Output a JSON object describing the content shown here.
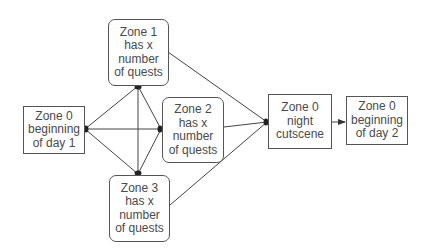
{
  "diagram": {
    "nodes": [
      {
        "id": "zone0_day1",
        "shape": "rect",
        "lines": [
          "Zone 0",
          "beginning",
          "of day 1"
        ]
      },
      {
        "id": "zone1",
        "shape": "rounded",
        "lines": [
          "Zone 1",
          "has x",
          "number",
          "of quests"
        ]
      },
      {
        "id": "zone2",
        "shape": "rounded",
        "lines": [
          "Zone 2",
          "has x",
          "number",
          "of quests"
        ]
      },
      {
        "id": "zone3",
        "shape": "rounded",
        "lines": [
          "Zone 3",
          "has x",
          "number",
          "of quests"
        ]
      },
      {
        "id": "zone0_night",
        "shape": "rect",
        "lines": [
          "Zone 0",
          "night",
          "cutscene"
        ]
      },
      {
        "id": "zone0_day2",
        "shape": "rect",
        "lines": [
          "Zone 0",
          "beginning",
          "of day 2"
        ]
      }
    ],
    "edges": [
      {
        "from": "zone0_day1",
        "to": "zone1",
        "bidirectional": true
      },
      {
        "from": "zone0_day1",
        "to": "zone2",
        "bidirectional": true
      },
      {
        "from": "zone0_day1",
        "to": "zone3",
        "bidirectional": true
      },
      {
        "from": "zone1",
        "to": "zone2",
        "bidirectional": true
      },
      {
        "from": "zone1",
        "to": "zone3",
        "bidirectional": true
      },
      {
        "from": "zone2",
        "to": "zone3",
        "bidirectional": true
      },
      {
        "from": "zone1",
        "to": "zone0_night"
      },
      {
        "from": "zone2",
        "to": "zone0_night"
      },
      {
        "from": "zone3",
        "to": "zone0_night"
      },
      {
        "from": "zone0_night",
        "to": "zone0_day2"
      }
    ]
  }
}
